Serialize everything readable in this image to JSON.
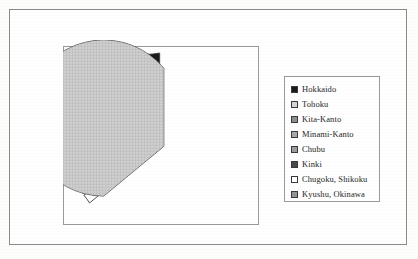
{
  "figure": {
    "background_color": "#ffffff",
    "frame_color": "#8a8a88",
    "plot_border_color": "#9a9a98"
  },
  "legend": {
    "position": "right",
    "border_color": "#9a9a98",
    "items": [
      {
        "label": "Hokkaido",
        "color": "#1a1a1a"
      },
      {
        "label": "Tohoku",
        "color": "#d6d6d6"
      },
      {
        "label": "Kita-Kanto",
        "color": "#8f8f8f"
      },
      {
        "label": "Minami-Kanto",
        "color": "#a8a8a8"
      },
      {
        "label": "Chubu",
        "color": "#9c9c9c"
      },
      {
        "label": "Kinki",
        "color": "#4a4a4a"
      },
      {
        "label": "Chugoku, Shikoku",
        "color": "#ffffff"
      },
      {
        "label": "Kyushu, Okinawa",
        "color": "#949494"
      }
    ]
  },
  "chart_data": {
    "type": "pie",
    "title": "",
    "exploded": true,
    "grid": false,
    "legend_position": "right",
    "labels": [
      "Hokkaido",
      "Tohoku",
      "Kita-Kanto",
      "Minami-Kanto",
      "Chubu",
      "Kinki",
      "Chugoku, Shikoku",
      "Kyushu, Okinawa"
    ],
    "values": [
      3,
      8,
      6,
      10,
      4,
      3,
      2,
      64
    ],
    "colors": [
      "#1a1a1a",
      "#d6d6d6",
      "#8f8f8f",
      "#a8a8a8",
      "#9c9c9c",
      "#4a4a4a",
      "#ffffff",
      "#949494"
    ],
    "slice_edge_color": "#3f3f3f",
    "start_angle_deg": 90,
    "explode_offsets": [
      0.18,
      0.18,
      0.18,
      0.18,
      0.18,
      0.18,
      0.18,
      0.04
    ]
  }
}
